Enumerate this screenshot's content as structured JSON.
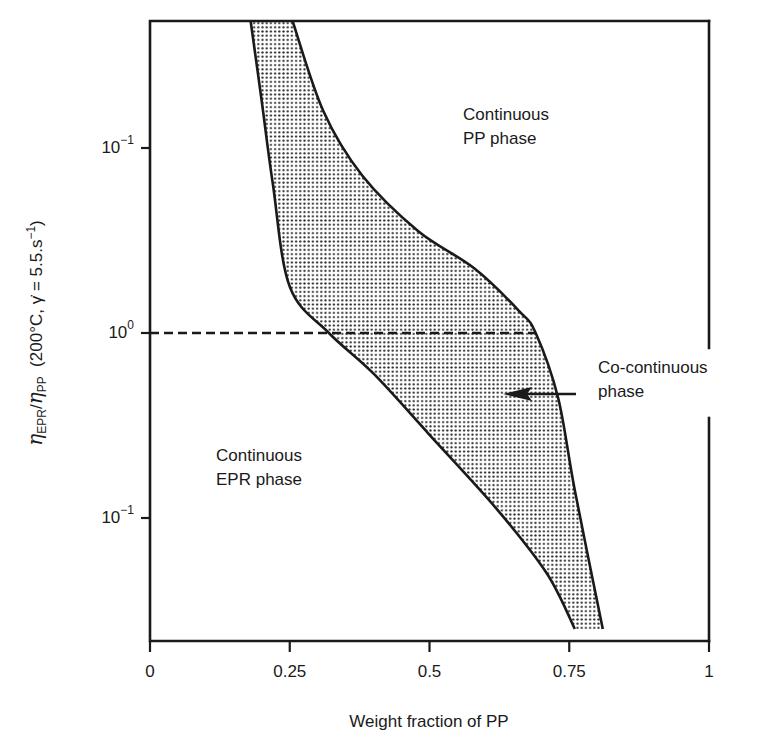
{
  "chart_data": {
    "type": "area",
    "title": "",
    "xlabel": "Weight fraction of PP",
    "ylabel": {
      "eta": "η",
      "sub1": "EPR",
      "slash": "/",
      "eta2": "η",
      "sub2": "PP",
      "conditions_prefix": "  (200°C, ",
      "gamma": "γ̇",
      "conditions_mid": " = 5.5.s",
      "exp": "−1",
      "conditions_suffix": ")"
    },
    "xlim": [
      0,
      1
    ],
    "ylim_log10": [
      -1.6,
      1.7
    ],
    "xticks": [
      {
        "value": 0,
        "label": "0"
      },
      {
        "value": 0.25,
        "label": "0.25"
      },
      {
        "value": 0.5,
        "label": "0.5"
      },
      {
        "value": 0.75,
        "label": "0.75"
      },
      {
        "value": 1,
        "label": "1"
      }
    ],
    "yticks": [
      {
        "log10": 1,
        "base": "10",
        "exp": "−1"
      },
      {
        "log10": 0,
        "base": "10",
        "exp": "0"
      },
      {
        "log10": -1,
        "base": "10",
        "exp": "−1"
      }
    ],
    "grid": false,
    "series": [
      {
        "name": "Lower boundary (left edge of co-continuous region)",
        "points": [
          {
            "x": 0.18,
            "y_log10": 1.7
          },
          {
            "x": 0.2,
            "y_log10": 1.25
          },
          {
            "x": 0.22,
            "y_log10": 0.8
          },
          {
            "x": 0.25,
            "y_log10": 0.25
          },
          {
            "x": 0.32,
            "y_log10": 0.0
          },
          {
            "x": 0.4,
            "y_log10": -0.22
          },
          {
            "x": 0.5,
            "y_log10": -0.55
          },
          {
            "x": 0.62,
            "y_log10": -0.95
          },
          {
            "x": 0.71,
            "y_log10": -1.3
          },
          {
            "x": 0.76,
            "y_log10": -1.6
          }
        ]
      },
      {
        "name": "Upper boundary (right edge of co-continuous region)",
        "points": [
          {
            "x": 0.255,
            "y_log10": 1.7
          },
          {
            "x": 0.31,
            "y_log10": 1.2
          },
          {
            "x": 0.38,
            "y_log10": 0.85
          },
          {
            "x": 0.48,
            "y_log10": 0.55
          },
          {
            "x": 0.58,
            "y_log10": 0.35
          },
          {
            "x": 0.66,
            "y_log10": 0.12
          },
          {
            "x": 0.69,
            "y_log10": 0.0
          },
          {
            "x": 0.73,
            "y_log10": -0.35
          },
          {
            "x": 0.76,
            "y_log10": -0.85
          },
          {
            "x": 0.81,
            "y_log10": -1.6
          }
        ]
      }
    ],
    "reference_line": {
      "style": "dashed",
      "y_log10": 0,
      "x_from": 0,
      "x_to": 0.69
    },
    "annotations": [
      {
        "text": [
          "Continuous",
          "PP phase"
        ],
        "x": 0.51,
        "y_log10": 1.05
      },
      {
        "text": [
          "Continuous",
          "EPR phase"
        ],
        "x": 0.12,
        "y_log10": -0.85
      },
      {
        "text": [
          "Co-continuous",
          "phase"
        ],
        "x": 0.8,
        "y_log10": -0.2,
        "arrow_to": {
          "x": 0.63,
          "y_log10": -0.33
        }
      }
    ],
    "fill": "stippled grey between boundaries"
  },
  "colors": {
    "ink": "#1a1a1a",
    "fill_dot": "#2a2a2a",
    "background": "#ffffff"
  }
}
